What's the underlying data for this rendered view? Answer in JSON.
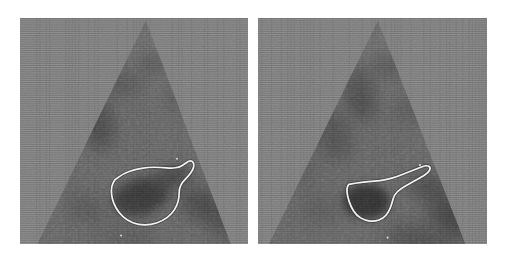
{
  "figure": {
    "kind": "ultrasound-echocardiogram-pair",
    "modality_label": "B-mode ultrasound sector scan",
    "panel_count": 2,
    "background_color": "#ffffff",
    "canvas": {
      "width": 509,
      "height": 261
    }
  },
  "palette": {
    "page_background": "#ffffff",
    "tissue_background": "#8a8a8a",
    "sector_fill": "#6f6f6f",
    "sector_dark_speckle": "#4a4a4a",
    "sector_deep_shadow": "#333333",
    "contour_stroke": "#f2f2f2",
    "contour_shadow": "#2e2e2e",
    "scanline_overlay": "#000000"
  },
  "panels": [
    {
      "id": "panel-left",
      "name": "left-ultrasound-panel",
      "caption": "",
      "rect": {
        "x": 20,
        "y": 18,
        "width": 228,
        "height": 226
      },
      "sector": {
        "apex": {
          "x": 117,
          "y": 2
        },
        "left_base": {
          "x": 16,
          "y": 212
        },
        "right_base": {
          "x": 196,
          "y": 212
        },
        "description": "triangular ultrasound fan, apex top-centre"
      },
      "contour": {
        "id": "contour-left",
        "name": "left-region-of-interest-contour",
        "shape_label": "teardrop",
        "stroke_color": "#f2f2f2",
        "stroke_width": 1.6,
        "points": [
          [
            88,
            152
          ],
          [
            96,
            146
          ],
          [
            107,
            142
          ],
          [
            119,
            140
          ],
          [
            131,
            140
          ],
          [
            141,
            141
          ],
          [
            148,
            140
          ],
          [
            153,
            137
          ],
          [
            157,
            134
          ],
          [
            160,
            134
          ],
          [
            162,
            137
          ],
          [
            161,
            142
          ],
          [
            157,
            148
          ],
          [
            151,
            154
          ],
          [
            148,
            160
          ],
          [
            148,
            168
          ],
          [
            146,
            176
          ],
          [
            141,
            184
          ],
          [
            133,
            190
          ],
          [
            122,
            194
          ],
          [
            110,
            194
          ],
          [
            100,
            190
          ],
          [
            92,
            183
          ],
          [
            87,
            174
          ],
          [
            85,
            166
          ],
          [
            85,
            158
          ],
          [
            88,
            152
          ]
        ]
      },
      "speckle_blobs": [
        {
          "cx": 70,
          "cy": 95,
          "rx": 16,
          "ry": 30,
          "rot": -20,
          "tone": "#4f4f4f",
          "blur": 7
        },
        {
          "cx": 96,
          "cy": 60,
          "rx": 22,
          "ry": 14,
          "rot": 10,
          "tone": "#5a5a5a",
          "blur": 7
        },
        {
          "cx": 124,
          "cy": 44,
          "rx": 14,
          "ry": 11,
          "rot": 0,
          "tone": "#575757",
          "blur": 6
        },
        {
          "cx": 150,
          "cy": 72,
          "rx": 20,
          "ry": 12,
          "rot": -8,
          "tone": "#606060",
          "blur": 8
        },
        {
          "cx": 112,
          "cy": 168,
          "rx": 27,
          "ry": 17,
          "rot": -14,
          "tone": "#3a3a3a",
          "blur": 5
        },
        {
          "cx": 140,
          "cy": 150,
          "rx": 20,
          "ry": 9,
          "rot": -18,
          "tone": "#464646",
          "blur": 6
        },
        {
          "cx": 172,
          "cy": 176,
          "rx": 26,
          "ry": 14,
          "rot": 24,
          "tone": "#4c4c4c",
          "blur": 8
        },
        {
          "cx": 196,
          "cy": 196,
          "rx": 24,
          "ry": 12,
          "rot": 30,
          "tone": "#525252",
          "blur": 8
        },
        {
          "cx": 62,
          "cy": 178,
          "rx": 18,
          "ry": 12,
          "rot": 16,
          "tone": "#5c5c5c",
          "blur": 8
        },
        {
          "cx": 100,
          "cy": 206,
          "rx": 30,
          "ry": 10,
          "rot": 4,
          "tone": "#5e5e5e",
          "blur": 9
        }
      ]
    },
    {
      "id": "panel-right",
      "name": "right-ultrasound-panel",
      "caption": "",
      "rect": {
        "x": 258,
        "y": 18,
        "width": 229,
        "height": 226
      },
      "sector": {
        "apex": {
          "x": 111,
          "y": 2
        },
        "left_base": {
          "x": 10,
          "y": 212
        },
        "right_base": {
          "x": 192,
          "y": 212
        },
        "description": "triangular ultrasound fan, apex top-centre"
      },
      "contour": {
        "id": "contour-right",
        "name": "right-region-of-interest-contour",
        "shape_label": "funnel-with-tail",
        "stroke_color": "#f2f2f2",
        "stroke_width": 1.6,
        "points": [
          [
            84,
            156
          ],
          [
            96,
            154
          ],
          [
            108,
            153
          ],
          [
            118,
            152
          ],
          [
            128,
            149
          ],
          [
            138,
            145
          ],
          [
            148,
            141
          ],
          [
            156,
            138
          ],
          [
            160,
            140
          ],
          [
            158,
            145
          ],
          [
            150,
            150
          ],
          [
            141,
            155
          ],
          [
            132,
            160
          ],
          [
            126,
            166
          ],
          [
            124,
            174
          ],
          [
            121,
            182
          ],
          [
            116,
            188
          ],
          [
            108,
            191
          ],
          [
            99,
            190
          ],
          [
            91,
            185
          ],
          [
            86,
            177
          ],
          [
            83,
            168
          ],
          [
            82,
            160
          ],
          [
            84,
            156
          ]
        ]
      },
      "speckle_blobs": [
        {
          "cx": 96,
          "cy": 70,
          "rx": 14,
          "ry": 26,
          "rot": -6,
          "tone": "#4d4d4d",
          "blur": 7
        },
        {
          "cx": 70,
          "cy": 110,
          "rx": 16,
          "ry": 26,
          "rot": -16,
          "tone": "#565656",
          "blur": 8
        },
        {
          "cx": 120,
          "cy": 46,
          "rx": 16,
          "ry": 12,
          "rot": 0,
          "tone": "#565656",
          "blur": 6
        },
        {
          "cx": 146,
          "cy": 86,
          "rx": 20,
          "ry": 14,
          "rot": 10,
          "tone": "#606060",
          "blur": 8
        },
        {
          "cx": 100,
          "cy": 172,
          "rx": 22,
          "ry": 16,
          "rot": 0,
          "tone": "#333333",
          "blur": 4
        },
        {
          "cx": 160,
          "cy": 160,
          "rx": 22,
          "ry": 12,
          "rot": 18,
          "tone": "#4e4e4e",
          "blur": 8
        },
        {
          "cx": 182,
          "cy": 188,
          "rx": 26,
          "ry": 16,
          "rot": 32,
          "tone": "#464646",
          "blur": 8
        },
        {
          "cx": 150,
          "cy": 208,
          "rx": 32,
          "ry": 12,
          "rot": 8,
          "tone": "#4f4f4f",
          "blur": 9
        },
        {
          "cx": 58,
          "cy": 180,
          "rx": 18,
          "ry": 12,
          "rot": 14,
          "tone": "#5e5e5e",
          "blur": 9
        },
        {
          "cx": 40,
          "cy": 140,
          "rx": 14,
          "ry": 18,
          "rot": -10,
          "tone": "#646464",
          "blur": 9
        }
      ]
    }
  ]
}
